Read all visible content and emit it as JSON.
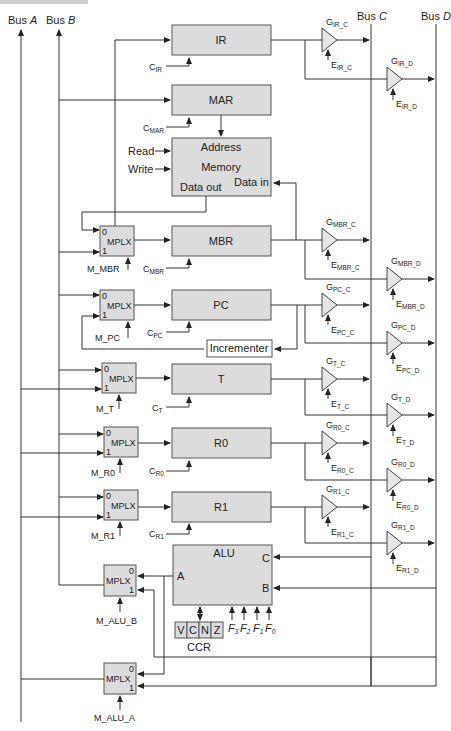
{
  "buses": {
    "a": "Bus A",
    "b": "Bus B",
    "c": "Bus C",
    "d": "Bus D",
    "a_prefix": "Bus ",
    "a_letter": "A",
    "b_letter": "B",
    "c_letter": "C",
    "d_letter": "D"
  },
  "registers": {
    "ir": "IR",
    "mar": "MAR",
    "mbr": "MBR",
    "pc": "PC",
    "t": "T",
    "r0": "R0",
    "r1": "R1"
  },
  "memory": {
    "address": "Address",
    "memory": "Memory",
    "data_out": "Data out",
    "data_in": "Data in",
    "read": "Read",
    "write": "Write"
  },
  "incrementer": "Incrementer",
  "mplx": {
    "label": "MPLX",
    "in0": "0",
    "in1": "1",
    "selects": {
      "mbr": "M_MBR",
      "pc": "M_PC",
      "t": "M_T",
      "r0": "M_R0",
      "r1": "M_R1",
      "alu_b": "M_ALU_B",
      "alu_a": "M_ALU_A"
    }
  },
  "clocks": {
    "prefix": "C",
    "ir": "IR",
    "mar": "MAR",
    "mbr": "MBR",
    "pc": "PC",
    "t": "T",
    "r0": "R0",
    "r1": "R1"
  },
  "gates": {
    "g": "G",
    "e": "E",
    "items": [
      {
        "sub": "IR_C"
      },
      {
        "sub": "IR_D"
      },
      {
        "sub": "MBR_C"
      },
      {
        "sub": "MBR_D"
      },
      {
        "sub": "PC_C"
      },
      {
        "sub": "PC_D"
      },
      {
        "sub": "T_C"
      },
      {
        "sub": "T_D"
      },
      {
        "sub": "R0_C"
      },
      {
        "sub": "R0_D"
      },
      {
        "sub": "R1_C"
      },
      {
        "sub": "R1_D"
      }
    ]
  },
  "alu": {
    "label": "ALU",
    "a": "A",
    "b": "B",
    "c": "C",
    "functions": [
      {
        "f": "F",
        "n": "3"
      },
      {
        "f": "F",
        "n": "2"
      },
      {
        "f": "F",
        "n": "1"
      },
      {
        "f": "F",
        "n": "0"
      }
    ]
  },
  "ccr": {
    "label": "CCR",
    "flags": [
      "V",
      "C",
      "N",
      "Z"
    ]
  }
}
